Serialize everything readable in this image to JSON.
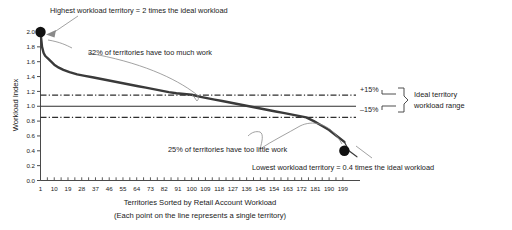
{
  "chart_data": {
    "type": "line",
    "title": "",
    "xlabel": "Territories Sorted by Retail Account Workload",
    "xlabel_sub": "(Each point on the line represents a single territory)",
    "ylabel": "Workload Index",
    "xlim": [
      1,
      205
    ],
    "ylim": [
      0.0,
      2.0
    ],
    "grid": false,
    "legend": "none",
    "xticks": [
      1,
      10,
      19,
      28,
      37,
      46,
      55,
      64,
      73,
      82,
      91,
      100,
      109,
      118,
      127,
      136,
      145,
      154,
      163,
      172,
      181,
      190,
      199
    ],
    "ytick_labels": [
      "0.0",
      "0.2",
      "0.4",
      "0.6",
      "0.8",
      "1.0",
      "1.2",
      "1.4",
      "1.6",
      "1.8",
      "2.0"
    ],
    "yticks": [
      0.0,
      0.2,
      0.4,
      0.6,
      0.8,
      1.0,
      1.2,
      1.4,
      1.6,
      1.8,
      2.0
    ],
    "series": [
      {
        "name": "Workload Index",
        "x": [
          1,
          2,
          3,
          4,
          5,
          6,
          8,
          10,
          13,
          16,
          20,
          25,
          30,
          35,
          40,
          45,
          50,
          55,
          60,
          65,
          70,
          75,
          80,
          85,
          90,
          95,
          100,
          105,
          110,
          115,
          120,
          125,
          130,
          135,
          140,
          145,
          150,
          155,
          160,
          165,
          170,
          175,
          180,
          185,
          190,
          195,
          200,
          203
        ],
        "values": [
          2.0,
          1.8,
          1.72,
          1.68,
          1.66,
          1.64,
          1.6,
          1.56,
          1.52,
          1.49,
          1.46,
          1.43,
          1.41,
          1.39,
          1.37,
          1.35,
          1.33,
          1.31,
          1.29,
          1.27,
          1.25,
          1.23,
          1.21,
          1.19,
          1.175,
          1.165,
          1.155,
          1.13,
          1.11,
          1.09,
          1.07,
          1.05,
          1.03,
          1.01,
          0.99,
          0.97,
          0.95,
          0.93,
          0.91,
          0.89,
          0.87,
          0.85,
          0.8,
          0.74,
          0.68,
          0.6,
          0.52,
          0.4
        ]
      }
    ],
    "markers": [
      {
        "name": "highest-workload-point",
        "x": 1,
        "y": 2.0
      },
      {
        "name": "lowest-workload-point",
        "x": 200,
        "y": 0.4
      }
    ],
    "reference_lines": [
      {
        "name": "ideal-workload-line",
        "y": 1.0,
        "style": "solid",
        "label": ""
      },
      {
        "name": "plus-15-line",
        "y": 1.15,
        "style": "dash-dot",
        "label": "+15%"
      },
      {
        "name": "minus-15-line",
        "y": 0.85,
        "style": "dash-dot",
        "label": "–15%"
      }
    ],
    "annotations": [
      {
        "name": "highest-workload-annotation",
        "text": "Highest workload territory = 2 times the ideal workload"
      },
      {
        "name": "too-much-work-annotation",
        "text": "32% of territories have too much work"
      },
      {
        "name": "too-little-work-annotation",
        "text": "25% of territories have too little work"
      },
      {
        "name": "lowest-workload-annotation",
        "text": "Lowest workload territory = 0.4 times the ideal workload"
      },
      {
        "name": "ideal-range-bracket-label-line1",
        "text": "Ideal territory"
      },
      {
        "name": "ideal-range-bracket-label-line2",
        "text": "workload range"
      }
    ],
    "colors": {
      "line": "#3a3a3a",
      "axis": "#4a4a4a",
      "text": "#1a1a1a",
      "marker": "#111111",
      "leader": "#8a8a8a"
    }
  }
}
